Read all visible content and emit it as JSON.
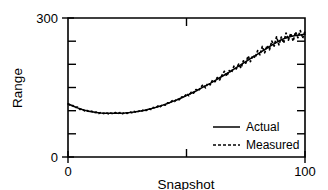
{
  "chart_data": {
    "type": "line",
    "title": "",
    "xlabel": "Snapshot",
    "ylabel": "Range",
    "xlim": [
      0,
      100
    ],
    "ylim": [
      0,
      300
    ],
    "grid": false,
    "legend_position": "bottom-right",
    "x_ticks": [
      0,
      50,
      100
    ],
    "x_tick_labels": [
      "0",
      "",
      "100"
    ],
    "y_ticks": [
      0,
      50,
      100,
      150,
      200,
      250,
      300
    ],
    "y_tick_labels": [
      "0",
      "",
      "",
      "",
      "",
      "",
      "300"
    ],
    "series": [
      {
        "name": "Actual",
        "style": "solid",
        "color": "#000000",
        "x": [
          0,
          2,
          4,
          6,
          8,
          10,
          12,
          14,
          16,
          18,
          20,
          22,
          24,
          26,
          28,
          30,
          32,
          34,
          36,
          38,
          40,
          42,
          44,
          46,
          48,
          50,
          52,
          54,
          56,
          58,
          60,
          62,
          64,
          66,
          68,
          70,
          72,
          74,
          76,
          78,
          80,
          82,
          84,
          86,
          88,
          90,
          92,
          94,
          96,
          98,
          100
        ],
        "values": [
          115,
          110,
          106,
          102.5,
          99.5,
          97.5,
          96,
          95,
          94.5,
          94.3,
          94.3,
          94.5,
          95,
          95.8,
          97,
          98.5,
          100.5,
          103,
          105.5,
          108.5,
          112,
          115.5,
          119.5,
          123.5,
          128,
          132.5,
          137.5,
          142.5,
          148,
          153.5,
          159,
          165,
          171,
          177,
          183,
          189.5,
          196,
          202.5,
          209,
          215.5,
          222,
          228.5,
          235,
          241.5,
          247.5,
          253,
          257,
          260,
          262,
          263.5,
          265
        ]
      },
      {
        "name": "Measured",
        "style": "dashed",
        "color": "#000000",
        "x": [
          0,
          1,
          2,
          3,
          4,
          5,
          6,
          7,
          8,
          9,
          10,
          11,
          12,
          13,
          14,
          15,
          16,
          17,
          18,
          19,
          20,
          21,
          22,
          23,
          24,
          25,
          26,
          27,
          28,
          29,
          30,
          31,
          32,
          33,
          34,
          35,
          36,
          37,
          38,
          39,
          40,
          41,
          42,
          43,
          44,
          45,
          46,
          47,
          48,
          49,
          50,
          51,
          52,
          53,
          54,
          55,
          56,
          57,
          58,
          59,
          60,
          61,
          62,
          63,
          64,
          65,
          66,
          67,
          68,
          69,
          70,
          71,
          72,
          73,
          74,
          75,
          76,
          77,
          78,
          79,
          80,
          81,
          82,
          83,
          84,
          85,
          86,
          87,
          88,
          89,
          90,
          91,
          92,
          93,
          94,
          95,
          96,
          97,
          98,
          99,
          100
        ],
        "values": [
          115,
          112.5,
          110,
          108,
          106,
          104,
          102.5,
          101,
          99.5,
          98.5,
          97.5,
          96.8,
          96,
          95.5,
          95,
          94.7,
          94.5,
          94.4,
          94.3,
          94.3,
          94.3,
          94.4,
          94.5,
          94.7,
          95,
          95.4,
          95.8,
          96.4,
          97,
          97.7,
          98.5,
          99.5,
          100.5,
          101.7,
          103,
          104.2,
          105.5,
          107,
          108.5,
          110.2,
          112,
          113.7,
          115.5,
          117.5,
          119.5,
          121.5,
          123.5,
          125.7,
          128,
          130,
          132.5,
          136,
          137.5,
          140,
          142.5,
          145,
          148,
          151,
          153.5,
          156,
          159,
          162,
          165,
          168,
          171,
          174,
          177,
          180,
          183,
          186,
          189.5,
          193,
          196,
          199,
          202.5,
          206,
          209,
          212,
          215.5,
          219,
          222,
          225,
          228.5,
          232,
          235,
          238,
          241.5,
          244.5,
          247.5,
          250,
          253,
          255,
          257,
          258.5,
          260,
          261,
          262,
          263,
          263.5,
          264,
          265
        ],
        "noise": [
          0,
          -1.5,
          1.2,
          -0.8,
          1.5,
          -1.2,
          0.9,
          -1.4,
          1.1,
          -0.7,
          1.3,
          -1.1,
          0.8,
          -1.5,
          1.4,
          -0.9,
          1.2,
          -1.3,
          0.7,
          -1.1,
          1.5,
          -0.8,
          1.2,
          -1.4,
          0.9,
          -1.2,
          1.6,
          -1.0,
          1.3,
          -1.5,
          1.1,
          -0.8,
          1.7,
          -1.3,
          1.0,
          -1.6,
          1.4,
          -1.1,
          1.8,
          -1.4,
          1.2,
          -1.7,
          1.5,
          -1.2,
          2.0,
          -1.5,
          1.3,
          -1.9,
          1.6,
          -1.3,
          4.5,
          -3.8,
          2.5,
          -2.2,
          3.0,
          -2.6,
          2.2,
          5.0,
          -4.2,
          2.8,
          -3.2,
          4.0,
          -2.5,
          3.5,
          -4.5,
          2.8,
          8.0,
          -5.5,
          3.5,
          -4.0,
          6.5,
          -3.0,
          4.5,
          -7.0,
          5.0,
          -3.5,
          9.0,
          -6.0,
          4.0,
          -5.0,
          7.5,
          -4.5,
          10.0,
          -7.0,
          5.5,
          -6.5,
          8.5,
          -5.0,
          12.0,
          -8.0,
          6.0,
          -9.0,
          10.5,
          -6.5,
          7.0,
          -11.0,
          8.0,
          -5.5,
          9.5,
          -7.5,
          6.0
        ]
      }
    ]
  },
  "legend": {
    "entries": [
      {
        "label": "Actual",
        "style": "solid"
      },
      {
        "label": "Measured",
        "style": "dashed"
      }
    ]
  },
  "axes": {
    "y_label": "Range",
    "x_label": "Snapshot",
    "y_max_label": "300",
    "y_min_label": "0",
    "x_min_label": "0",
    "x_max_label": "100"
  }
}
